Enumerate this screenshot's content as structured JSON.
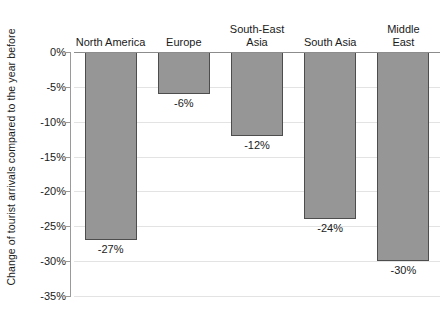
{
  "chart_data": {
    "type": "bar",
    "title": "",
    "subtitle": "",
    "xlabel": "",
    "ylabel": "Change of tourist arrivals compared to the year before",
    "categories": [
      "North America",
      "Europe",
      "South-East\nAsia",
      "South Asia",
      "Middle East"
    ],
    "values": [
      -27,
      -6,
      -12,
      -24,
      -30
    ],
    "data_labels": [
      "-27%",
      "-6%",
      "-12%",
      "-24%",
      "-30%"
    ],
    "ylim": [
      -35,
      0
    ],
    "ytick_values": [
      0,
      -5,
      -10,
      -15,
      -20,
      -25,
      -30,
      -35
    ],
    "ytick_labels": [
      "0%",
      "-5%",
      "-10%",
      "-15%",
      "-20%",
      "-25%",
      "-30%",
      "-35%"
    ],
    "grid": true,
    "grid_axis": "y",
    "legend": false,
    "legend_position": "none",
    "series": [
      {
        "name": "Change of tourist arrivals",
        "values": [
          -27,
          -6,
          -12,
          -24,
          -30
        ]
      }
    ],
    "colors": {
      "bar_fill": "#969696",
      "bar_border": "#4d4d4d",
      "gridline": "#e3e3e3",
      "axis": "#9a9a9a",
      "zero_line": "#8c8c8c",
      "text": "#1a1a1a",
      "background": "#ffffff"
    }
  }
}
